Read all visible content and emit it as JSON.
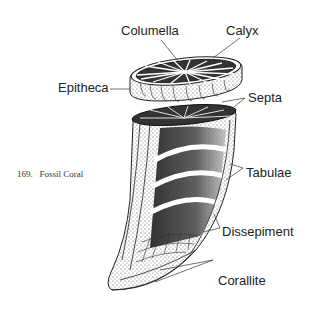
{
  "figure": {
    "number": "169.",
    "caption": "Fossil Coral"
  },
  "labels": {
    "columella": "Columella",
    "calyx": "Calyx",
    "epitheca": "Epitheca",
    "septa": "Septa",
    "tabulae": "Tabulae",
    "dissepiment": "Dissepiment",
    "corallite": "Corallite"
  },
  "colors": {
    "ink": "#1a1a1a",
    "background": "#ffffff"
  }
}
